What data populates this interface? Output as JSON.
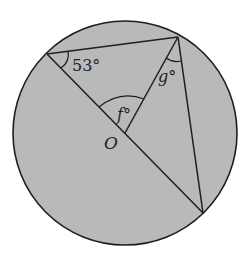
{
  "diagram": {
    "circle": {
      "cx": 125,
      "cy": 133,
      "r": 112,
      "fill": "#b9b9b9",
      "stroke": "#1e1e1e"
    },
    "points": {
      "A": {
        "x": 47,
        "y": 54
      },
      "B": {
        "x": 178,
        "y": 37
      },
      "C": {
        "x": 203,
        "y": 213
      },
      "O": {
        "x": 125,
        "y": 133
      }
    },
    "labels": {
      "angle_a": "53°",
      "angle_f": "f°",
      "angle_g": "g°",
      "center": "O"
    },
    "segments": [
      "A-B",
      "A-C",
      "B-O",
      "B-C"
    ],
    "colors": {
      "line": "#1e1e1e",
      "fill": "#b9b9b9",
      "text": "#222222"
    }
  }
}
